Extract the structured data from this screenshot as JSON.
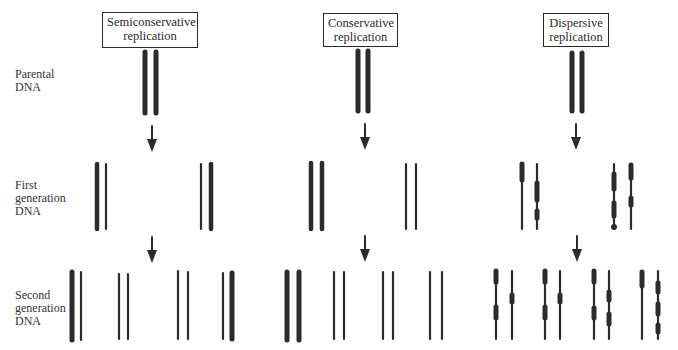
{
  "columns": [
    {
      "id": "semiconservative",
      "title_line1": "Semiconservative",
      "title_line2": "replication"
    },
    {
      "id": "conservative",
      "title_line1": "Conservative",
      "title_line2": "replication"
    },
    {
      "id": "dispersive",
      "title_line1": "Dispersive",
      "title_line2": "replication"
    }
  ],
  "rows": [
    {
      "id": "parental",
      "label_line1": "Parental",
      "label_line2": "DNA",
      "label_line3": ""
    },
    {
      "id": "first",
      "label_line1": "First",
      "label_line2": "generation",
      "label_line3": "DNA"
    },
    {
      "id": "second",
      "label_line1": "Second",
      "label_line2": "generation",
      "label_line3": "DNA"
    }
  ],
  "legend_semantics": {
    "thick_strand": "parental (old) DNA strand",
    "thin_strand": "newly synthesized DNA strand",
    "segmented_strand": "mixed old/new DNA segments (dispersive)"
  },
  "colors": {
    "strand": "#2b2b2b",
    "box_border": "#2a2a2a",
    "background": "#ffffff"
  }
}
